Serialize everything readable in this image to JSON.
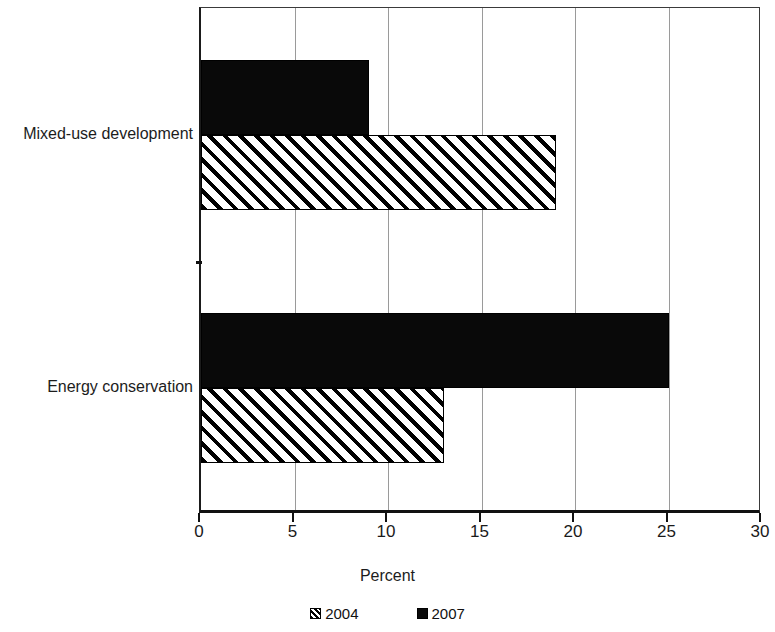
{
  "chart_data": {
    "type": "bar",
    "orientation": "horizontal",
    "title": "",
    "xlabel": "Percent",
    "ylabel": "",
    "xlim": [
      0,
      30
    ],
    "xticks": [
      0,
      5,
      10,
      15,
      20,
      25,
      30
    ],
    "xtick_labels": [
      "0",
      "5",
      "10",
      "15",
      "20",
      "25",
      "30"
    ],
    "grid": true,
    "grid_axis": "x",
    "legend_position": "bottom",
    "categories": [
      "Mixed-use development",
      "Energy conservation"
    ],
    "series": [
      {
        "name": "2004",
        "style": "hatched",
        "color": "#000000",
        "values": [
          19,
          13
        ]
      },
      {
        "name": "2007",
        "style": "solid",
        "color": "#000000",
        "values": [
          9,
          25
        ]
      }
    ]
  },
  "legend": {
    "items": [
      {
        "label": "2004",
        "swatch": "hatch-swatch-icon"
      },
      {
        "label": "2007",
        "swatch": "solid-swatch-icon"
      }
    ]
  }
}
